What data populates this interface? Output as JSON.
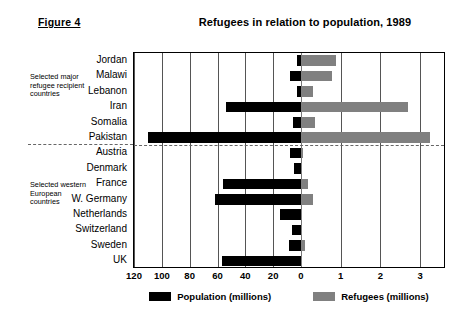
{
  "figure": {
    "caption": "Figure 4",
    "title": "Refugees in relation to population, 1989"
  },
  "annotations": {
    "major_group": "Selected major refugee recipient countries",
    "western_group": "Selected western European countries"
  },
  "colors": {
    "population": "#000000",
    "refugees": "#808080",
    "grid": "#555555",
    "background": "#ffffff"
  },
  "chart_data": {
    "type": "bar",
    "title": "Refugees in relation to population, 1989",
    "xlabel": "",
    "ylabel": "",
    "orientation": "horizontal",
    "layout": "diverging-dual-axis",
    "grid": true,
    "legend_position": "bottom",
    "left_axis": {
      "name": "Population (millions)",
      "ticks": [
        120,
        100,
        80,
        60,
        40,
        20,
        0
      ],
      "range": [
        120,
        0
      ],
      "direction": "right-to-left"
    },
    "right_axis": {
      "name": "Refugees (millions)",
      "ticks": [
        0,
        1,
        2,
        3
      ],
      "range": [
        0,
        3.6
      ],
      "direction": "left-to-right"
    },
    "categories": [
      "Jordan",
      "Malawi",
      "Lebanon",
      "Iran",
      "Somalia",
      "Pakistan",
      "Austria",
      "Denmark",
      "France",
      "W. Germany",
      "Netherlands",
      "Switzerland",
      "Sweden",
      "UK"
    ],
    "groups": [
      {
        "label": "Selected major refugee recipient countries",
        "categories": [
          "Jordan",
          "Malawi",
          "Lebanon",
          "Iran",
          "Somalia",
          "Pakistan"
        ]
      },
      {
        "label": "Selected western European countries",
        "categories": [
          "Austria",
          "Denmark",
          "France",
          "W. Germany",
          "Netherlands",
          "Switzerland",
          "Sweden",
          "UK"
        ]
      }
    ],
    "series": [
      {
        "name": "Population (millions)",
        "color": "#000000",
        "values": [
          3.0,
          8.2,
          2.8,
          54.0,
          6.1,
          110.0,
          7.6,
          5.1,
          56.0,
          62.0,
          14.8,
          6.6,
          8.5,
          57.0
        ]
      },
      {
        "name": "Refugees (millions)",
        "color": "#808080",
        "values": [
          0.87,
          0.77,
          0.3,
          2.7,
          0.35,
          3.25,
          0.04,
          0.03,
          0.18,
          0.3,
          0.03,
          0.03,
          0.1,
          0.03
        ]
      }
    ],
    "legend": [
      {
        "label": "Population (millions)",
        "color": "#000000"
      },
      {
        "label": "Refugees (millions)",
        "color": "#808080"
      }
    ]
  }
}
